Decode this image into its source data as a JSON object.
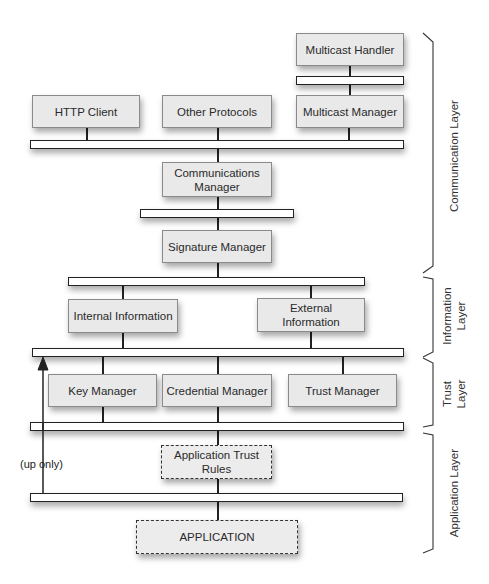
{
  "diagram": {
    "components": {
      "multicast_handler": "Multicast Handler",
      "http_client": "HTTP Client",
      "other_protocols": "Other Protocols",
      "multicast_manager": "Multicast Manager",
      "communications_manager_line1": "Communications",
      "communications_manager_line2": "Manager",
      "signature_manager": "Signature Manager",
      "internal_information": "Internal Information",
      "external_information_line1": "External",
      "external_information_line2": "Information",
      "key_manager": "Key Manager",
      "credential_manager": "Credential Manager",
      "trust_manager": "Trust Manager",
      "application_trust_rules_line1": "Application Trust",
      "application_trust_rules_line2": "Rules",
      "application": "APPLICATION"
    },
    "annotations": {
      "up_only": "(up only)"
    },
    "layers": {
      "communication": "Communication Layer",
      "information_line1": "Information",
      "information_line2": "Layer",
      "trust_line1": "Trust",
      "trust_line2": "Layer",
      "application": "Application Layer"
    },
    "colors": {
      "box_fill": "#e9e9e9",
      "box_border": "#8a8a8a",
      "bar_fill": "#ffffff",
      "line": "#222222"
    }
  }
}
